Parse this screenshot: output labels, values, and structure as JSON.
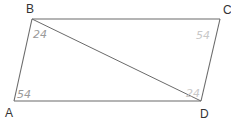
{
  "diagram": {
    "type": "parallelogram-with-diagonal",
    "vertices": {
      "A": {
        "label": "A",
        "x": 14,
        "y": 101,
        "label_x": 5,
        "label_y": 117
      },
      "B": {
        "label": "B",
        "x": 32,
        "y": 19,
        "label_x": 26,
        "label_y": 13
      },
      "C": {
        "label": "C",
        "x": 220,
        "y": 19,
        "label_x": 223,
        "label_y": 14
      },
      "D": {
        "label": "D",
        "x": 201,
        "y": 101,
        "label_x": 200,
        "label_y": 118
      }
    },
    "edges": [
      "AB",
      "BC",
      "CD",
      "DA"
    ],
    "diagonal": "BD",
    "angle_annotations": {
      "B": {
        "text": "24",
        "x": 33,
        "y": 38
      },
      "C": {
        "text": "54",
        "x": 196,
        "y": 39
      },
      "A": {
        "text": "54",
        "x": 17,
        "y": 98
      },
      "D": {
        "text": "24",
        "x": 186,
        "y": 97
      }
    },
    "colors": {
      "line": "#6a6a6a",
      "label": "#333333",
      "annotation": "#9a9a9a",
      "annotation_faint": "#c8c8c8"
    }
  }
}
